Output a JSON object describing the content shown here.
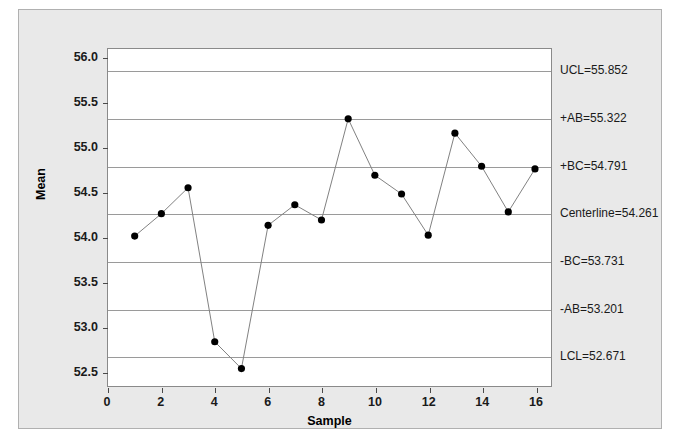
{
  "chart_data": {
    "type": "line",
    "title": "",
    "xlabel": "Sample",
    "ylabel": "Mean",
    "xlim": [
      0,
      16.6
    ],
    "ylim": [
      52.33,
      56.1
    ],
    "grid": true,
    "legend": "none",
    "x": [
      1,
      2,
      3,
      4,
      5,
      6,
      7,
      8,
      9,
      10,
      11,
      12,
      13,
      14,
      15,
      16
    ],
    "values": [
      54.01,
      54.26,
      54.55,
      52.83,
      52.53,
      54.13,
      54.36,
      54.19,
      55.32,
      54.69,
      54.48,
      54.02,
      55.16,
      54.79,
      54.28,
      54.76
    ],
    "xticks": [
      0,
      2,
      4,
      6,
      8,
      10,
      12,
      14,
      16
    ],
    "xtick_labels": [
      "0",
      "2",
      "4",
      "6",
      "8",
      "10",
      "12",
      "14",
      "16"
    ],
    "yticks": [
      52.5,
      53.0,
      53.5,
      54.0,
      54.5,
      55.0,
      55.5,
      56.0
    ],
    "ytick_labels": [
      "52.5",
      "53.0",
      "53.5",
      "54.0",
      "54.5",
      "55.0",
      "55.5",
      "56.0"
    ],
    "control_limits": [
      {
        "name": "UCL",
        "label": "UCL=55.852",
        "value": 55.852
      },
      {
        "name": "+AB",
        "label": "+AB=55.322",
        "value": 55.322
      },
      {
        "name": "+BC",
        "label": "+BC=54.791",
        "value": 54.791
      },
      {
        "name": "Centerline",
        "label": "Centerline=54.261",
        "value": 54.261
      },
      {
        "name": "-BC",
        "label": "-BC=53.731",
        "value": 53.731
      },
      {
        "name": "-AB",
        "label": "-AB=53.201",
        "value": 53.201
      },
      {
        "name": "LCL",
        "label": "LCL=52.671",
        "value": 52.671
      }
    ],
    "colors": {
      "marker": "#000000",
      "line": "#808080",
      "gridline": "#9a9a9a",
      "panel_background": "#e9e9e9",
      "plot_background": "#ffffff",
      "axis": "#4a4a4a"
    }
  }
}
